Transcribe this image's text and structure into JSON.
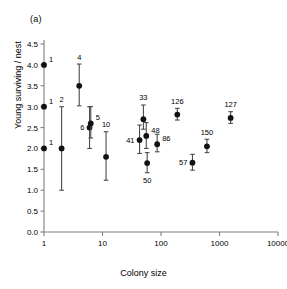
{
  "figure": {
    "panel_label": "(a)",
    "background_color": "#ffffff",
    "point_color": "#111111",
    "axis_color": "#808080",
    "errorbar_color": "#4a4a4a"
  },
  "chart_data": {
    "type": "scatter",
    "title": "(a)",
    "xlabel": "Colony size",
    "ylabel": "Young surviving / nest",
    "xscale": "log",
    "yscale": "linear",
    "xlim": [
      1,
      10000
    ],
    "ylim": [
      0.0,
      4.5
    ],
    "grid": false,
    "legend": false,
    "xticks": [
      1,
      10,
      100,
      1000,
      10000
    ],
    "xtick_labels": [
      "1",
      "10",
      "100",
      "1000",
      "10000"
    ],
    "yticks": [
      0.0,
      0.5,
      1.0,
      1.5,
      2.0,
      2.5,
      3.0,
      3.5,
      4.0,
      4.5
    ],
    "ytick_labels": [
      "0.0",
      "0.5",
      "1.0",
      "1.5",
      "2.0",
      "2.5",
      "3.0",
      "3.5",
      "4.0",
      "4.5"
    ],
    "marker": "filled-circle",
    "error_bars": "vertical",
    "point_label_note": "Each point is annotated with its colony size (sample) value",
    "points": [
      {
        "label": "1",
        "x": 1,
        "y": 4.0,
        "ylo": 4.0,
        "yhi": 4.0,
        "label_pos": "right"
      },
      {
        "label": "1",
        "x": 1,
        "y": 3.0,
        "ylo": 3.0,
        "yhi": 3.0,
        "label_pos": "right"
      },
      {
        "label": "1",
        "x": 1,
        "y": 2.0,
        "ylo": 2.0,
        "yhi": 2.0,
        "label_pos": "right"
      },
      {
        "label": "2",
        "x": 2,
        "y": 2.0,
        "ylo": 1.0,
        "yhi": 3.0,
        "label_pos": "top"
      },
      {
        "label": "4",
        "x": 4,
        "y": 3.5,
        "ylo": 3.02,
        "yhi": 4.02,
        "label_pos": "top"
      },
      {
        "label": "6",
        "x": 6,
        "y": 2.5,
        "ylo": 2.0,
        "yhi": 3.0,
        "label_pos": "left"
      },
      {
        "label": "5",
        "x": 6.3,
        "y": 2.6,
        "ylo": 2.25,
        "yhi": 3.0,
        "label_pos": "right"
      },
      {
        "label": "10",
        "x": 11.5,
        "y": 1.8,
        "ylo": 1.24,
        "yhi": 2.4,
        "label_pos": "top"
      },
      {
        "label": "41",
        "x": 43,
        "y": 2.2,
        "ylo": 1.88,
        "yhi": 2.56,
        "label_pos": "left"
      },
      {
        "label": "33",
        "x": 50,
        "y": 2.7,
        "ylo": 2.46,
        "yhi": 3.04,
        "label_pos": "top"
      },
      {
        "label": "48",
        "x": 56,
        "y": 2.3,
        "ylo": 2.0,
        "yhi": 2.62,
        "label_pos": "right"
      },
      {
        "label": "50",
        "x": 58,
        "y": 1.65,
        "ylo": 1.42,
        "yhi": 1.9,
        "label_pos": "bottom"
      },
      {
        "label": "86",
        "x": 86,
        "y": 2.1,
        "ylo": 1.92,
        "yhi": 2.34,
        "label_pos": "right"
      },
      {
        "label": "126",
        "x": 190,
        "y": 2.81,
        "ylo": 2.68,
        "yhi": 2.96,
        "label_pos": "top"
      },
      {
        "label": "57",
        "x": 345,
        "y": 1.66,
        "ylo": 1.48,
        "yhi": 1.86,
        "label_pos": "left"
      },
      {
        "label": "150",
        "x": 610,
        "y": 2.05,
        "ylo": 1.9,
        "yhi": 2.22,
        "label_pos": "top"
      },
      {
        "label": "127",
        "x": 1550,
        "y": 2.73,
        "ylo": 2.6,
        "yhi": 2.88,
        "label_pos": "top"
      }
    ]
  }
}
